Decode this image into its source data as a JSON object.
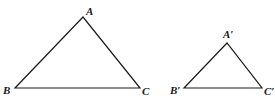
{
  "diagram": {
    "triangles": [
      {
        "name": "ABC",
        "vertices": {
          "A": {
            "label": "A",
            "x": 83,
            "y": 17
          },
          "B": {
            "label": "B",
            "x": 15,
            "y": 88
          },
          "C": {
            "label": "C",
            "x": 140,
            "y": 88
          }
        },
        "label_positions": {
          "A": {
            "x": 86,
            "y": 15
          },
          "B": {
            "x": 3,
            "y": 94
          },
          "C": {
            "x": 142,
            "y": 95
          }
        }
      },
      {
        "name": "A'B'C'",
        "vertices": {
          "A": {
            "label": "A′",
            "x": 227,
            "y": 43
          },
          "B": {
            "label": "B′",
            "x": 184,
            "y": 88
          },
          "C": {
            "label": "C′",
            "x": 262,
            "y": 88
          }
        },
        "label_positions": {
          "A": {
            "x": 223,
            "y": 38
          },
          "B": {
            "x": 170,
            "y": 94
          },
          "C": {
            "x": 264,
            "y": 95
          }
        }
      }
    ],
    "colors": {
      "stroke": "#1a1a1a",
      "background": "#ffffff"
    }
  }
}
